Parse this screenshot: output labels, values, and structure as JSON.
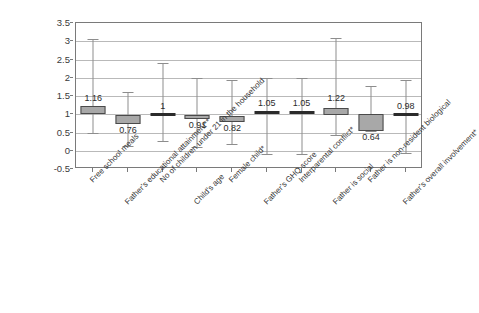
{
  "chart_data": {
    "type": "bar",
    "chart_style": "box-and-whisker with 95% confidence intervals (odds ratios)",
    "title": "",
    "subtitle": "",
    "xlabel": "",
    "ylabel": "",
    "ylim": [
      -0.5,
      3.5
    ],
    "grid": true,
    "legend": false,
    "legend_position": "none",
    "yticks": [
      "3.5",
      "3",
      "2.5",
      "2",
      "1.5",
      "1",
      "0.5",
      "0",
      "-0.5"
    ],
    "ytick_values": [
      3.5,
      3,
      2.5,
      2,
      1.5,
      1,
      0.5,
      0,
      -0.5
    ],
    "categories": [
      "Free school meals",
      "Father's educational attainment**",
      "No of children under 21 in the household",
      "Child's age",
      "Female child*",
      "Father's GHQ score",
      "Interparental conflict*",
      "Father is social",
      "Father is non-resident biological",
      "Father's overall involvement*"
    ],
    "values": [
      1.16,
      0.76,
      1.0,
      0.91,
      0.82,
      1.05,
      1.05,
      1.22,
      0.64,
      0.98
    ],
    "data_labels": [
      "1.16",
      "0.76",
      "1",
      "0.91",
      "0.82",
      "1.05",
      "1.05",
      "1.22",
      "0.64",
      "0.98"
    ],
    "series": [
      {
        "name": "Odds ratio with box and whiskers",
        "points": [
          {
            "category": "Free school meals",
            "value": 1.16,
            "label": "1.16",
            "box_low": 1.02,
            "box_high": 1.22,
            "whisker_low": 0.48,
            "whisker_high": 3.05,
            "label_position": "above"
          },
          {
            "category": "Father's educational attainment**",
            "value": 0.76,
            "label": "0.76",
            "box_low": 0.74,
            "box_high": 0.98,
            "whisker_low": 0.12,
            "whisker_high": 1.62,
            "label_position": "below"
          },
          {
            "category": "No of children under 21 in the household",
            "value": 1.0,
            "label": "1",
            "box_low": 0.99,
            "box_high": 1.01,
            "whisker_low": 0.28,
            "whisker_high": 2.4,
            "label_position": "above"
          },
          {
            "category": "Child's age",
            "value": 0.91,
            "label": "0.91",
            "box_low": 0.88,
            "box_high": 0.98,
            "whisker_low": 0.1,
            "whisker_high": 2.0,
            "label_position": "below"
          },
          {
            "category": "Female child*",
            "value": 0.82,
            "label": "0.82",
            "box_low": 0.78,
            "box_high": 0.96,
            "whisker_low": 0.18,
            "whisker_high": 1.95,
            "label_position": "below"
          },
          {
            "category": "Father's GHQ score",
            "value": 1.05,
            "label": "1.05",
            "box_low": 1.02,
            "box_high": 1.08,
            "whisker_low": -0.08,
            "whisker_high": 2.0,
            "label_position": "above"
          },
          {
            "category": "Interparental conflict*",
            "value": 1.05,
            "label": "1.05",
            "box_low": 1.02,
            "box_high": 1.08,
            "whisker_low": -0.08,
            "whisker_high": 2.0,
            "label_position": "above"
          },
          {
            "category": "Father is social",
            "value": 1.22,
            "label": "1.22",
            "box_low": 0.97,
            "box_high": 1.18,
            "whisker_low": 0.42,
            "whisker_high": 3.1,
            "label_position": "above"
          },
          {
            "category": "Father is non-resident biological",
            "value": 0.64,
            "label": "0.64",
            "box_low": 0.55,
            "box_high": 1.0,
            "whisker_low": 0.55,
            "whisker_high": 1.78,
            "label_position": "below"
          },
          {
            "category": "Father's overall involvement*",
            "value": 0.98,
            "label": "0.98",
            "box_low": 0.95,
            "box_high": 1.0,
            "whisker_low": -0.05,
            "whisker_high": 1.95,
            "label_position": "above"
          }
        ]
      }
    ],
    "colors": {
      "box_fill": "#a8a8a8",
      "box_border": "#4a4a4a",
      "whisker": "#8d8d8d",
      "gridline": "#b9b9b9",
      "frame": "#7a7a7a",
      "text": "#333333",
      "background": "#ffffff"
    }
  }
}
